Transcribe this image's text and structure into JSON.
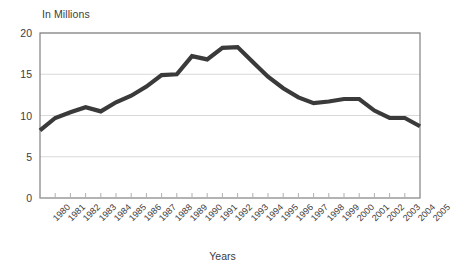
{
  "chart_data": {
    "type": "line",
    "title": "",
    "ylabel": "In Millions",
    "xlabel": "Years",
    "ylim": [
      0,
      20
    ],
    "yticks": [
      0,
      5,
      10,
      15,
      20
    ],
    "ytick_labels": [
      "0",
      "5",
      "10",
      "15",
      "20"
    ],
    "grid": true,
    "legend": "none",
    "categories": [
      "1980",
      "1981",
      "1982",
      "1983",
      "1984",
      "1985",
      "1986",
      "1987",
      "1988",
      "1989",
      "1990",
      "1991",
      "1992",
      "1993",
      "1994",
      "1995",
      "1996",
      "1997",
      "1998",
      "1999",
      "2000",
      "2001",
      "2002",
      "2003",
      "2004",
      "2005"
    ],
    "values": [
      8.2,
      9.7,
      10.4,
      11.0,
      10.5,
      11.6,
      12.4,
      13.5,
      14.9,
      15.0,
      17.2,
      16.8,
      18.2,
      18.3,
      16.5,
      14.7,
      13.3,
      12.2,
      11.5,
      11.7,
      12.0,
      12.0,
      10.6,
      9.7,
      9.7,
      8.7
    ],
    "series_color": "#3a3a3a",
    "gridline_color": "#d9d9d9",
    "axis_color": "#808080"
  }
}
